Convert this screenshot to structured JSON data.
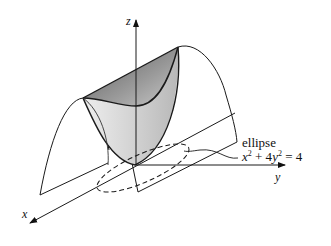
{
  "figure": {
    "axes": {
      "x_label": "x",
      "y_label": "y",
      "z_label": "z"
    },
    "annotation": {
      "label": "ellipse",
      "equation_parts": {
        "x": "x",
        "x_exp": "2",
        "plus": " + 4",
        "y": "y",
        "y_exp": "2",
        "rhs": " = 4"
      },
      "equation_text": "x² + 4y² = 4"
    },
    "colors": {
      "line": "#1a1a1a",
      "shade_dark": "#6e6e6e",
      "shade_light": "#e2e2e2"
    }
  }
}
